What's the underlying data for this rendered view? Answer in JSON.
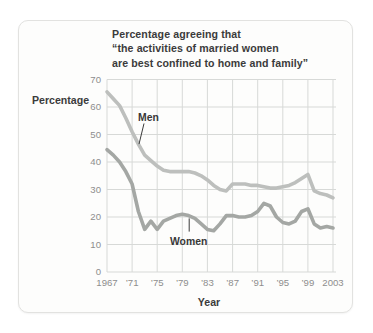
{
  "page": {
    "background": "#ffffff"
  },
  "card": {
    "background": "#fdfdfc",
    "border_color": "#e2e2e0",
    "title_lines": [
      "Percentage agreeing that",
      "“the activities of married women",
      "are best confined to home and family”"
    ]
  },
  "chart_data": {
    "type": "line",
    "title": "Percentage agreeing that “the activities of married women are best confined to home and family”",
    "xlabel": "Year",
    "ylabel": "Percentage",
    "xlim": [
      1967,
      2003
    ],
    "ylim": [
      0,
      70
    ],
    "grid": true,
    "legend_position": "inline-annotations",
    "y_ticks": [
      0,
      10,
      20,
      30,
      40,
      50,
      60,
      70
    ],
    "x_ticks": [
      {
        "year": 1967,
        "label": "1967"
      },
      {
        "year": 1971,
        "label": "’71"
      },
      {
        "year": 1975,
        "label": "’75"
      },
      {
        "year": 1979,
        "label": "’79"
      },
      {
        "year": 1983,
        "label": "’83"
      },
      {
        "year": 1987,
        "label": "’87"
      },
      {
        "year": 1991,
        "label": "’91"
      },
      {
        "year": 1995,
        "label": "’95"
      },
      {
        "year": 1999,
        "label": "’99"
      },
      {
        "year": 2003,
        "label": "2003"
      }
    ],
    "x": [
      1967,
      1968,
      1969,
      1970,
      1971,
      1972,
      1973,
      1974,
      1975,
      1976,
      1977,
      1978,
      1979,
      1980,
      1981,
      1982,
      1983,
      1984,
      1985,
      1986,
      1987,
      1988,
      1989,
      1990,
      1991,
      1992,
      1993,
      1994,
      1995,
      1996,
      1997,
      1998,
      1999,
      2000,
      2001,
      2002,
      2003
    ],
    "series": [
      {
        "name": "Men",
        "color": "#bdbfbd",
        "values": [
          65.5,
          63,
          60.5,
          56,
          51,
          46.5,
          42.5,
          40.5,
          38.5,
          37,
          36.5,
          36.5,
          36.5,
          36.5,
          36,
          35,
          33.5,
          31.5,
          30,
          29.5,
          32,
          32,
          32,
          31.5,
          31.5,
          31,
          30.5,
          30.5,
          31,
          31.5,
          32.5,
          34,
          35.5,
          29.5,
          28.5,
          28,
          27
        ]
      },
      {
        "name": "Women",
        "color": "#a4a7a4",
        "values": [
          44.5,
          42.5,
          40,
          36.5,
          32,
          22,
          15.5,
          18.5,
          15.5,
          18.5,
          19.5,
          20.5,
          21,
          20.5,
          19.5,
          17.5,
          15.5,
          15,
          17.5,
          20.5,
          20.5,
          20,
          20,
          20.5,
          22,
          25,
          24,
          20,
          18,
          17.5,
          18.5,
          22,
          23,
          17.5,
          16,
          16.5,
          16
        ]
      }
    ],
    "annotations": [
      {
        "label": "Men",
        "text_at": {
          "year": 1973.6,
          "value": 56.5
        },
        "line": {
          "x1": 1972.9,
          "y1": 54,
          "x2": 1972.1,
          "y2": 46.5
        }
      },
      {
        "label": "Women",
        "text_at": {
          "year": 1980,
          "value": 11.3
        },
        "line": {
          "x1": 1980.1,
          "y1": 19.5,
          "x2": 1980.1,
          "y2": 14.7
        }
      }
    ],
    "colors": {
      "grid": "#d7d9d7",
      "tick_text": "#8d8d8d",
      "label_text": "#3b3b3b"
    }
  }
}
